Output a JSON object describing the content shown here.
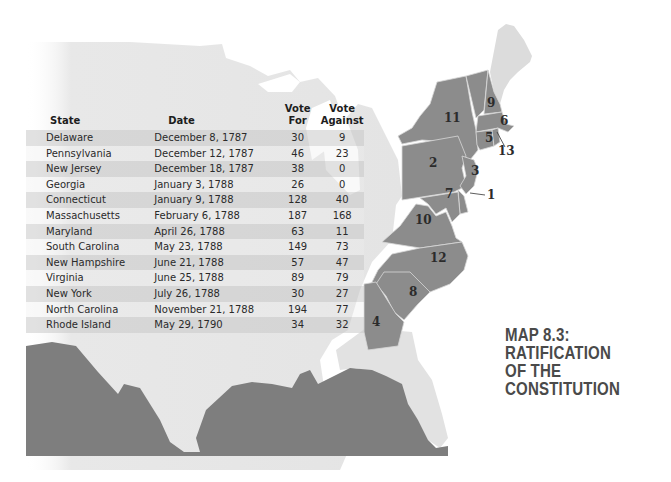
{
  "title": {
    "line1": "MAP 8.3: RATIFICATION",
    "line2": "OF THE CONSTITUTION"
  },
  "colors": {
    "ratifying_states": "#8c8c8c",
    "other_land": "#e6e6e6",
    "water": "#7e7e7e",
    "background": "#ffffff",
    "title_text": "#4a4a4a"
  },
  "table": {
    "headers": {
      "state": "State",
      "date": "Date",
      "vote_for": "Vote For",
      "vote_against": "Vote Against"
    },
    "rows": [
      {
        "order": 1,
        "state": "Delaware",
        "date": "December 8, 1787",
        "vote_for": "30",
        "vote_against": "9"
      },
      {
        "order": 2,
        "state": "Pennsylvania",
        "date": "December 12, 1787",
        "vote_for": "46",
        "vote_against": "23"
      },
      {
        "order": 3,
        "state": "New Jersey",
        "date": "December 18, 1787",
        "vote_for": "38",
        "vote_against": "0"
      },
      {
        "order": 4,
        "state": "Georgia",
        "date": "January 3, 1788",
        "vote_for": "26",
        "vote_against": "0"
      },
      {
        "order": 5,
        "state": "Connecticut",
        "date": "January 9, 1788",
        "vote_for": "128",
        "vote_against": "40"
      },
      {
        "order": 6,
        "state": "Massachusetts",
        "date": "February 6, 1788",
        "vote_for": "187",
        "vote_against": "168"
      },
      {
        "order": 7,
        "state": "Maryland",
        "date": "April 26, 1788",
        "vote_for": "63",
        "vote_against": "11"
      },
      {
        "order": 8,
        "state": "South Carolina",
        "date": "May 23, 1788",
        "vote_for": "149",
        "vote_against": "73"
      },
      {
        "order": 9,
        "state": "New Hampshire",
        "date": "June 21, 1788",
        "vote_for": "57",
        "vote_against": "47"
      },
      {
        "order": 10,
        "state": "Virginia",
        "date": "June 25, 1788",
        "vote_for": "89",
        "vote_against": "79"
      },
      {
        "order": 11,
        "state": "New York",
        "date": "July 26, 1788",
        "vote_for": "30",
        "vote_against": "27"
      },
      {
        "order": 12,
        "state": "North Carolina",
        "date": "November 21, 1788",
        "vote_for": "194",
        "vote_against": "77"
      },
      {
        "order": 13,
        "state": "Rhode Island",
        "date": "May 29, 1790",
        "vote_for": "34",
        "vote_against": "32"
      }
    ]
  },
  "map_labels": [
    {
      "num": "1",
      "state": "Delaware"
    },
    {
      "num": "2",
      "state": "Pennsylvania"
    },
    {
      "num": "3",
      "state": "New Jersey"
    },
    {
      "num": "4",
      "state": "Georgia"
    },
    {
      "num": "5",
      "state": "Connecticut"
    },
    {
      "num": "6",
      "state": "Massachusetts"
    },
    {
      "num": "7",
      "state": "Maryland"
    },
    {
      "num": "8",
      "state": "South Carolina"
    },
    {
      "num": "9",
      "state": "New Hampshire"
    },
    {
      "num": "10",
      "state": "Virginia"
    },
    {
      "num": "11",
      "state": "New York"
    },
    {
      "num": "12",
      "state": "North Carolina"
    },
    {
      "num": "13",
      "state": "Rhode Island"
    }
  ]
}
